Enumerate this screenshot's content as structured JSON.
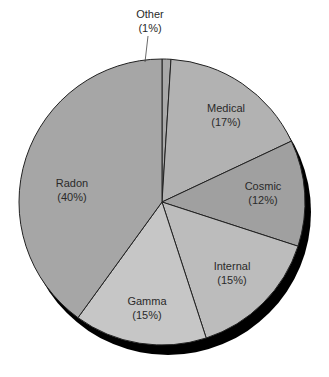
{
  "chart_data": {
    "type": "pie",
    "title": "",
    "categories": [
      "Other",
      "Medical",
      "Cosmic",
      "Internal",
      "Gamma",
      "Radon"
    ],
    "values": [
      1,
      17,
      12,
      15,
      15,
      40
    ],
    "labels": [
      "Other",
      "Medical",
      "Cosmic",
      "Internal",
      "Gamma",
      "Radon"
    ],
    "percent_labels": [
      "(1%)",
      "(17%)",
      "(12%)",
      "(15%)",
      "(15%)",
      "(40%)"
    ],
    "colors": [
      "#a8a8a8",
      "#b2b2b2",
      "#a0a0a0",
      "#bcbcbc",
      "#c6c6c6",
      "#a6a6a6"
    ],
    "legend": "none",
    "start_angle_deg": 0,
    "direction": "clockwise",
    "shadow": true
  },
  "geometry": {
    "cx": 162,
    "cy": 202,
    "r": 143,
    "shadow_dx": 6,
    "shadow_dy": 10,
    "shadow_color": "#000000",
    "edge_color": "#222222"
  },
  "label_positions": [
    {
      "x": 150,
      "y": 18,
      "external": true,
      "leader": [
        148,
        36,
        145,
        62
      ]
    },
    {
      "x": 226,
      "y": 112
    },
    {
      "x": 263,
      "y": 190
    },
    {
      "x": 232,
      "y": 270
    },
    {
      "x": 147,
      "y": 305
    },
    {
      "x": 72,
      "y": 187
    }
  ]
}
